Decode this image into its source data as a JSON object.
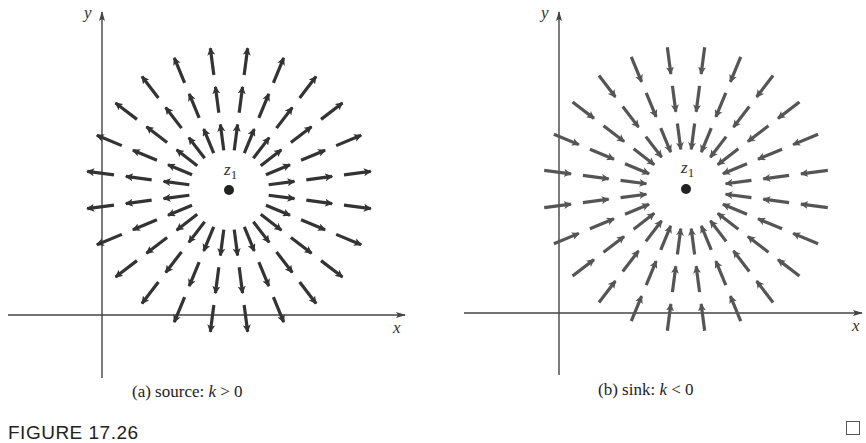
{
  "figure": {
    "label": "FIGURE 17.26",
    "end_mark": "square-end-of-example-icon"
  },
  "chart_data": {
    "type": "vector-field",
    "title": "FIGURE 17.26",
    "rays": {
      "count": 24,
      "angle_step_deg": 15,
      "angle_offset_deg": 7.5
    },
    "rings": [
      {
        "r_start": 40,
        "r_end": 66
      },
      {
        "r_start": 78,
        "r_end": 104
      },
      {
        "r_start": 116,
        "r_end": 143
      }
    ],
    "panels": [
      {
        "id": "a",
        "caption_prefix": "(a)  source: ",
        "caption_var": "k",
        "caption_suffix": " > 0",
        "direction": "outward",
        "point_label": "z",
        "point_subscript": "1",
        "xlabel": "x",
        "ylabel": "y",
        "arrow_color": "#333333",
        "center": [
          229,
          190
        ],
        "origin": [
          102,
          315
        ],
        "x_axis": [
          8,
          405
        ],
        "y_axis": [
          12,
          378
        ]
      },
      {
        "id": "b",
        "caption_prefix": "(b)  sink: ",
        "caption_var": "k",
        "caption_suffix": " < 0",
        "direction": "inward",
        "point_label": "z",
        "point_subscript": "1",
        "xlabel": "x",
        "ylabel": "y",
        "arrow_color": "#555555",
        "center": [
          686,
          189
        ],
        "origin": [
          559,
          313
        ],
        "x_axis": [
          464,
          862
        ],
        "y_axis": [
          12,
          375
        ]
      }
    ]
  }
}
